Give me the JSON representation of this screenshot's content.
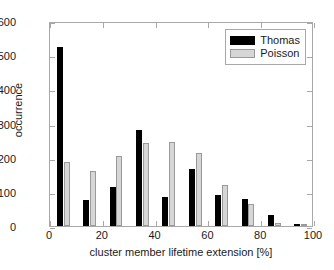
{
  "chart_data": {
    "type": "bar",
    "title": "",
    "subtitle": "",
    "xlabel": "cluster member lifetime extension [%]",
    "ylabel": "occurrence",
    "xlim": [
      0,
      100
    ],
    "ylim": [
      0,
      600
    ],
    "xticks": [
      0,
      20,
      40,
      60,
      80,
      100
    ],
    "yticks": [
      0,
      100,
      200,
      300,
      400,
      500,
      600
    ],
    "xtick_labels": [
      "0",
      "20",
      "40",
      "60",
      "80",
      "100"
    ],
    "ytick_labels": [
      "0",
      "100",
      "200",
      "300",
      "400",
      "500",
      "600"
    ],
    "grid": false,
    "legend_position": "top-right",
    "bin_width": 10,
    "bin_centers": [
      5,
      15,
      25,
      35,
      45,
      55,
      65,
      75,
      85,
      95
    ],
    "categories": [
      "0-10",
      "10-20",
      "20-30",
      "30-40",
      "40-50",
      "50-60",
      "60-70",
      "70-80",
      "80-90",
      "90-100"
    ],
    "series": [
      {
        "name": "Thomas",
        "color": "#000000",
        "values": [
          524,
          76,
          113,
          281,
          85,
          167,
          90,
          79,
          31,
          6
        ]
      },
      {
        "name": "Poisson",
        "color": "#d6d6d6",
        "values": [
          188,
          160,
          204,
          243,
          245,
          214,
          119,
          63,
          10,
          1
        ]
      }
    ],
    "annotations": []
  },
  "legend": {
    "entries": [
      {
        "label": "Thomas"
      },
      {
        "label": "Poisson"
      }
    ]
  }
}
